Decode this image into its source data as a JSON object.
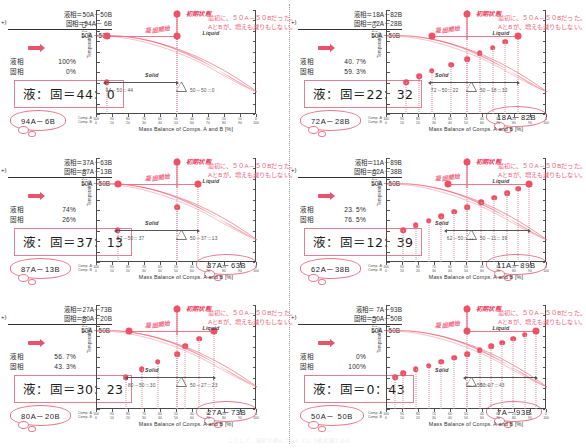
{
  "figure": {
    "x_axis_label": "Mass Balance of Comps. A and B [%]",
    "y_axis_label": "T [°C]",
    "y_axis_label2": "Temperature",
    "axis_row_a": "Comp. A",
    "axis_row_b": "Comp. B",
    "x_ticks_a": [
      "100",
      "90",
      "80",
      "70",
      "60",
      "50",
      "40",
      "30",
      "20",
      "10",
      "0"
    ],
    "x_ticks_b": [
      "0",
      "10",
      "20",
      "30",
      "40",
      "50",
      "60",
      "70",
      "80",
      "90",
      "100"
    ],
    "liquid_label": "Liquid",
    "solid_label": "Solid",
    "initial_state_label": "初期状態",
    "solidify_start_label": "凝固開始",
    "note_line1": "最初に、５０A－５０Bだった。",
    "note_line2": "AとBが、増えも減りもしない。",
    "sum_label": "50A－50B",
    "liquid_key": "液相",
    "solid_key": "固相",
    "plus_sign": "+)",
    "accent": "#ef5066",
    "accent_light": "#f5a7b6",
    "note_color": "#ef5d78"
  },
  "footer_caption": "こうして、凝固が進んでいくという模式図である",
  "panels": [
    {
      "id": "panel-1",
      "liquid_eq": "液相＝50A－50B",
      "solid_eq": "固相＝94A－ 6B",
      "liquid_pct": "100%",
      "solid_pct": "0%",
      "ratio": "液：固＝44：0",
      "lever_left": "94－50＝44",
      "lever_right": "50－50＝0",
      "cloud_left": "94A－6B",
      "cloud_right": "",
      "liquid_x": 50,
      "solid_x": 94,
      "dots": [
        50,
        94
      ]
    },
    {
      "id": "panel-2",
      "liquid_eq": "液相＝18A－82B",
      "solid_eq": "固相＝72A－28B",
      "liquid_pct": "40. 7%",
      "solid_pct": "59. 3%",
      "ratio": "液：固＝22：32",
      "lever_left": "72－50＝22",
      "lever_right": "50－18＝32",
      "cloud_left": "72A－28B",
      "cloud_right": "18A－82B",
      "liquid_x": 18,
      "solid_x": 72,
      "dots": [
        18,
        26,
        34,
        42,
        50,
        60,
        72,
        80,
        88
      ]
    },
    {
      "id": "panel-3",
      "liquid_eq": "液相＝37A－63B",
      "solid_eq": "固相＝87A－13B",
      "liquid_pct": "74%",
      "solid_pct": "26%",
      "ratio": "液：固＝37：13",
      "lever_left": "87－50＝37",
      "lever_right": "50－37＝13",
      "cloud_left": "87A－13B",
      "cloud_right": "37A－63B",
      "liquid_x": 37,
      "solid_x": 87,
      "dots": [
        37,
        50,
        87
      ]
    },
    {
      "id": "panel-4",
      "liquid_eq": "液相＝11A－89B",
      "solid_eq": "固相＝62A－38B",
      "liquid_pct": "23. 5%",
      "solid_pct": "76. 5%",
      "ratio": "液：固＝12：39",
      "lever_left": "62－50＝12",
      "lever_right": "50－11＝39",
      "cloud_left": "62A－38B",
      "cloud_right": "11A－89B",
      "liquid_x": 11,
      "solid_x": 62,
      "dots": [
        11,
        18,
        25,
        33,
        41,
        50,
        58,
        66,
        74,
        82,
        90
      ]
    },
    {
      "id": "panel-5",
      "liquid_eq": "液相＝27A－73B",
      "solid_eq": "固相＝80A－20B",
      "liquid_pct": "56. 7%",
      "solid_pct": "43. 3%",
      "ratio": "液：固＝30：23",
      "lever_left": "80－50＝30",
      "lever_right": "50－27＝23",
      "cloud_left": "80A－20B",
      "cloud_right": "27A－73B",
      "liquid_x": 27,
      "solid_x": 80,
      "dots": [
        27,
        36,
        45,
        50,
        62,
        72,
        82
      ]
    },
    {
      "id": "panel-6",
      "liquid_eq": "液相＝ 7A－93B",
      "solid_eq": "固相＝50A－50B",
      "liquid_pct": "0%",
      "solid_pct": "100%",
      "ratio": "液：固＝0：43",
      "lever_left": "50－50＝0",
      "lever_right": "50－7＝43",
      "cloud_left": "50A－ 50B",
      "cloud_right": "7A－93B",
      "liquid_x": 7,
      "solid_x": 50,
      "dots": [
        7,
        14,
        21,
        28,
        35,
        42,
        50,
        58,
        66,
        74,
        82,
        90,
        95
      ]
    }
  ]
}
